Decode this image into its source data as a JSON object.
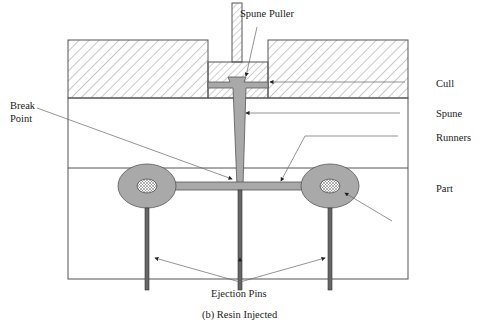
{
  "figure": {
    "caption": "(b) Resin Injected",
    "labels": {
      "spune_puller": "Spune Puller",
      "cull": "Cull",
      "spune": "Spune",
      "runners": "Runners",
      "part": "Part",
      "break_point_line1": "Break",
      "break_point_line2": "Point",
      "ejection_pins": "Ejection Pins"
    },
    "colors": {
      "resin": "#a9a9a9",
      "pin": "#555555",
      "outline": "#444444",
      "hatch": "#777777",
      "leader": "#666666"
    }
  }
}
